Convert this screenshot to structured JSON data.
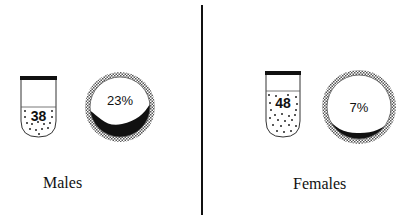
{
  "groups": [
    {
      "label": "Males",
      "tube_value": "38",
      "circle_value": "23%"
    },
    {
      "label": "Females",
      "tube_value": "48",
      "circle_value": "7%"
    }
  ],
  "colors": {
    "ink": "#111111",
    "background": "#ffffff",
    "hatch": "#8a8a8a"
  }
}
